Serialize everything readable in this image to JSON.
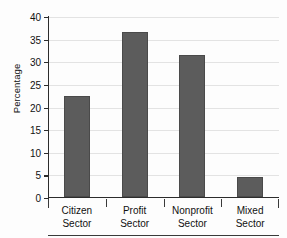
{
  "chart_data": {
    "type": "bar",
    "title": "",
    "subtitle": "",
    "xlabel": "",
    "ylabel": "Percentage",
    "categories": [
      "Citizen Sector",
      "Profit Sector",
      "Nonprofit Sector",
      "Mixed Sector"
    ],
    "category_lines": [
      [
        "Citizen",
        "Sector"
      ],
      [
        "Profit",
        "Sector"
      ],
      [
        "Nonprofit",
        "Sector"
      ],
      [
        "Mixed",
        "Sector"
      ]
    ],
    "values": [
      22.5,
      36.5,
      31.5,
      4.5
    ],
    "ylim": [
      0,
      40
    ],
    "yticks": [
      0,
      5,
      10,
      15,
      20,
      25,
      30,
      35,
      40
    ],
    "ytick_labels": [
      "0",
      "5",
      "10",
      "15",
      "20",
      "25",
      "30",
      "35",
      "40"
    ],
    "grid": true,
    "grid_axis": "y",
    "legend": false,
    "legend_position": "none",
    "bar_color": "#5c5c5c",
    "axis_color": "#2c2c2c",
    "grid_color": "#e3e3e3",
    "background": "#fdfdfd"
  }
}
